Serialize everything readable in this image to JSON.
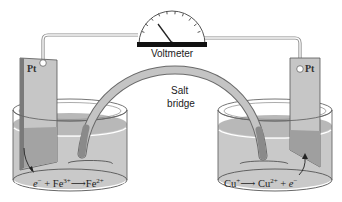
{
  "diagram": {
    "type": "galvanic-cell",
    "voltmeter": {
      "label": "Voltmeter"
    },
    "salt_bridge": {
      "label_line1": "Salt",
      "label_line2": "bridge"
    },
    "left_half_cell": {
      "electrode_label": "Pt",
      "reaction": {
        "electron": "e",
        "electron_charge": "−",
        "plus": "+",
        "reactant": "Fe",
        "reactant_charge": "3+",
        "arrow": "⟶",
        "product": "Fe",
        "product_charge": "2+"
      }
    },
    "right_half_cell": {
      "electrode_label": "Pt",
      "reaction": {
        "reactant": "Cu",
        "reactant_charge": "+",
        "arrow": "⟶",
        "product": "Cu",
        "product_charge": "2+",
        "plus": "+",
        "electron": "e",
        "electron_charge": "−"
      }
    },
    "colors": {
      "solution": "#c9c9c9",
      "solution_dark": "#a9a9a9",
      "electrode": "#c4c4c4",
      "electrode_edge": "#555555",
      "glass_line": "#666666",
      "wire": "#888888",
      "meter_base": "#111111",
      "bridge_fill": "#bdbdbd",
      "bridge_edge": "#6a6a6a"
    }
  }
}
